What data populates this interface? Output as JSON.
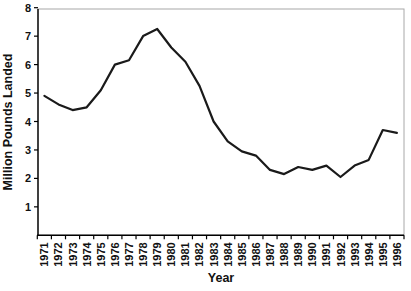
{
  "chart_data": {
    "type": "line",
    "title": "",
    "xlabel": "Year",
    "ylabel": "Million Pounds Landed",
    "categories": [
      "1971",
      "1972",
      "1973",
      "1974",
      "1975",
      "1976",
      "1977",
      "1978",
      "1979",
      "1980",
      "1981",
      "1982",
      "1983",
      "1984",
      "1985",
      "1986",
      "1987",
      "1988",
      "1989",
      "1990",
      "1991",
      "1992",
      "1993",
      "1994",
      "1995",
      "1996"
    ],
    "series": [
      {
        "name": "Million Pounds Landed",
        "values": [
          4.9,
          4.6,
          4.4,
          4.5,
          5.1,
          6.0,
          6.15,
          7.0,
          7.25,
          6.6,
          6.1,
          5.25,
          4.0,
          3.3,
          2.95,
          2.8,
          2.3,
          2.15,
          2.4,
          2.3,
          2.45,
          2.05,
          2.45,
          2.65,
          3.7,
          3.6
        ]
      }
    ],
    "ylim": [
      0,
      8
    ],
    "yticks": [
      "1",
      "2",
      "3",
      "4",
      "5",
      "6",
      "7",
      "8"
    ],
    "grid": "off",
    "legend": "none",
    "line_color": "#1a1a1a",
    "axis_color": "#000000",
    "plot_border_color": "#a8a8a8",
    "background_color": "#ffffff"
  }
}
